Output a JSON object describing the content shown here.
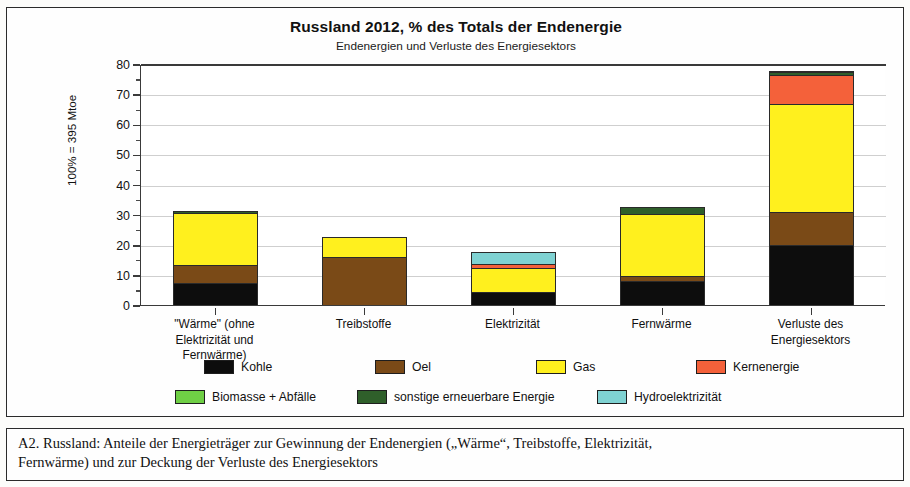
{
  "figure": {
    "caption_line1": "A2.  Russland:  Anteile der Energieträger zur Gewinnung der Endenergien („Wärme“, Treibstoffe, Elektrizität,",
    "caption_line2": "Fernwärme) und zur Deckung der Verluste des Energiesektors"
  },
  "chart_data": {
    "type": "bar",
    "stacked": true,
    "title": "Russland  2012,  % des Totals der Endenergie",
    "subtitle": "Endenergien und Verluste des Energiesektors",
    "xlabel": "",
    "ylabel": "100% = 395 Mtoe",
    "ylim": [
      0,
      80
    ],
    "ytick_step": 10,
    "yminor_step": 5,
    "grid": true,
    "legend_position": "bottom",
    "ytick_labels": [
      "0",
      "10",
      "20",
      "30",
      "40",
      "50",
      "60",
      "70",
      "80"
    ],
    "categories": [
      "\"Wärme\" (ohne\nElektrizität und\nFernwärme)",
      "Treibstoffe",
      "Elektrizität",
      "Fernwärme",
      "Verluste des\nEnergiesektors"
    ],
    "series": [
      {
        "name": "Kohle",
        "color": "#0d0d0d",
        "values": [
          7.0,
          0.0,
          4.0,
          7.5,
          19.5
        ]
      },
      {
        "name": "Oel",
        "color": "#7a4a17",
        "values": [
          6.0,
          15.5,
          0.0,
          1.8,
          11.0
        ]
      },
      {
        "name": "Gas",
        "color": "#fff01e",
        "values": [
          17.3,
          6.8,
          7.8,
          20.5,
          36.0
        ]
      },
      {
        "name": "Kernenergie",
        "color": "#f4613a",
        "values": [
          0.0,
          0.0,
          1.4,
          0.0,
          9.5
        ]
      },
      {
        "name": "Biomasse + Abfälle",
        "color": "#6fcf45",
        "values": [
          0.0,
          0.0,
          0.0,
          0.0,
          0.0
        ]
      },
      {
        "name": "sonstige erneuerbare Energie",
        "color": "#2f5f2a",
        "values": [
          0.7,
          0.0,
          0.0,
          2.5,
          1.0
        ]
      },
      {
        "name": "Hydroelektrizität",
        "color": "#7fd2d2",
        "values": [
          0.0,
          0.0,
          4.0,
          0.0,
          0.5
        ]
      }
    ],
    "totals": [
      31.0,
      22.3,
      17.2,
      32.3,
      77.5
    ]
  }
}
